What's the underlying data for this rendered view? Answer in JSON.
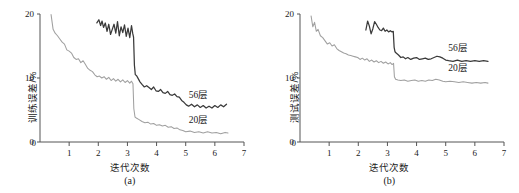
{
  "figure": {
    "caption_a": "(a)",
    "caption_b": "(b)",
    "colors": {
      "deep_series": "#3a3a3a",
      "shallow_series": "#a0a0a0",
      "axis": "#555555",
      "text": "#1a1a1a",
      "background": "#ffffff"
    }
  },
  "chart_data": [
    {
      "type": "line",
      "panel": "a",
      "title": "",
      "caption": "(a)",
      "xlabel": "迭代次数",
      "ylabel": "训练误差/%",
      "xlim": [
        0,
        7
      ],
      "ylim": [
        0,
        20
      ],
      "xticks": [
        0,
        1,
        2,
        3,
        4,
        5,
        6,
        7
      ],
      "xticklabels": [
        "0",
        "1",
        "2",
        "3",
        "4",
        "5",
        "6",
        "7"
      ],
      "yticks": [
        0,
        10,
        20
      ],
      "yticklabels": [
        "0",
        "10",
        "20"
      ],
      "grid": false,
      "legend_position": "inline-annotation",
      "annotations": [
        {
          "text": "56层",
          "x": 5.1,
          "y": 7.0
        },
        {
          "text": "20层",
          "x": 5.1,
          "y": 3.1
        }
      ],
      "series": [
        {
          "name": "56层",
          "color": "#3a3a3a",
          "x": [
            1.95,
            2.02,
            2.08,
            2.13,
            2.18,
            2.24,
            2.3,
            2.36,
            2.42,
            2.48,
            2.54,
            2.6,
            2.66,
            2.72,
            2.78,
            2.84,
            2.9,
            2.96,
            3.02,
            3.08,
            3.14,
            3.18,
            3.21,
            3.24,
            3.27,
            3.31,
            3.37,
            3.43,
            3.5,
            3.58,
            3.66,
            3.74,
            3.82,
            3.9,
            3.98,
            4.06,
            4.14,
            4.22,
            4.3,
            4.38,
            4.46,
            4.54,
            4.62,
            4.7,
            4.78,
            4.86,
            4.94,
            5.02,
            5.1,
            5.2,
            5.3,
            5.4,
            5.5,
            5.6,
            5.7,
            5.8,
            5.9,
            6.0,
            6.1,
            6.2,
            6.3,
            6.4
          ],
          "y": [
            18.6,
            19.1,
            18.2,
            18.9,
            17.9,
            18.6,
            17.3,
            18.4,
            16.8,
            17.6,
            18.4,
            17.0,
            18.8,
            16.6,
            18.0,
            17.1,
            18.3,
            16.5,
            17.8,
            16.3,
            18.2,
            17.0,
            16.4,
            12.0,
            10.5,
            10.4,
            9.9,
            9.4,
            9.0,
            8.6,
            8.8,
            8.5,
            8.2,
            8.6,
            8.0,
            7.9,
            8.2,
            7.7,
            7.6,
            7.9,
            7.4,
            7.3,
            7.5,
            7.1,
            7.0,
            6.5,
            6.2,
            5.8,
            5.6,
            5.9,
            5.5,
            5.8,
            5.4,
            5.7,
            5.3,
            5.6,
            5.3,
            5.7,
            5.4,
            5.8,
            5.5,
            5.9
          ]
        },
        {
          "name": "20层",
          "color": "#a0a0a0",
          "x": [
            0.38,
            0.45,
            0.52,
            0.6,
            0.68,
            0.76,
            0.84,
            0.92,
            1.0,
            1.08,
            1.16,
            1.24,
            1.32,
            1.4,
            1.48,
            1.56,
            1.64,
            1.72,
            1.8,
            1.88,
            1.96,
            2.04,
            2.12,
            2.2,
            2.28,
            2.36,
            2.44,
            2.52,
            2.6,
            2.68,
            2.76,
            2.84,
            2.92,
            3.0,
            3.08,
            3.14,
            3.19,
            3.22,
            3.26,
            3.32,
            3.4,
            3.5,
            3.6,
            3.7,
            3.8,
            3.9,
            4.0,
            4.1,
            4.2,
            4.3,
            4.4,
            4.5,
            4.6,
            4.7,
            4.8,
            4.9,
            5.0,
            5.15,
            5.3,
            5.45,
            5.6,
            5.75,
            5.9,
            6.05,
            6.2,
            6.35,
            6.45
          ],
          "y": [
            19.9,
            17.6,
            17.0,
            16.6,
            16.1,
            15.6,
            15.3,
            14.4,
            14.2,
            13.9,
            13.2,
            12.9,
            13.0,
            12.4,
            12.7,
            12.1,
            11.5,
            11.2,
            11.0,
            10.5,
            10.2,
            10.3,
            10.0,
            10.2,
            9.8,
            10.1,
            9.6,
            9.9,
            9.5,
            9.8,
            9.4,
            9.7,
            9.3,
            9.6,
            9.2,
            9.5,
            9.1,
            5.2,
            3.9,
            3.7,
            3.5,
            3.2,
            3.0,
            3.1,
            2.8,
            2.9,
            2.6,
            2.7,
            2.5,
            2.6,
            2.3,
            2.4,
            2.1,
            2.2,
            1.9,
            1.8,
            1.6,
            1.7,
            1.5,
            1.6,
            1.4,
            1.6,
            1.4,
            1.5,
            1.3,
            1.5,
            1.4
          ]
        }
      ]
    },
    {
      "type": "line",
      "panel": "b",
      "title": "",
      "caption": "(b)",
      "xlabel": "迭代次数",
      "ylabel": "测试误差/%",
      "xlim": [
        0,
        7
      ],
      "ylim": [
        0,
        20
      ],
      "xticks": [
        0,
        1,
        2,
        3,
        4,
        5,
        6,
        7
      ],
      "xticklabels": [
        "0",
        "1",
        "2",
        "3",
        "4",
        "5",
        "6",
        "7"
      ],
      "yticks": [
        0,
        10,
        20
      ],
      "yticklabels": [
        "0",
        "10",
        "20"
      ],
      "grid": false,
      "legend_position": "inline-annotation",
      "annotations": [
        {
          "text": "56层",
          "x": 5.1,
          "y": 14.3
        },
        {
          "text": "20层",
          "x": 5.1,
          "y": 11.2
        }
      ],
      "series": [
        {
          "name": "56层",
          "color": "#3a3a3a",
          "x": [
            2.26,
            2.32,
            2.38,
            2.44,
            2.5,
            2.56,
            2.62,
            2.68,
            2.74,
            2.8,
            2.86,
            2.92,
            2.98,
            3.04,
            3.1,
            3.16,
            3.2,
            3.23,
            3.26,
            3.3,
            3.38,
            3.46,
            3.54,
            3.62,
            3.7,
            3.8,
            3.9,
            4.0,
            4.1,
            4.2,
            4.3,
            4.4,
            4.5,
            4.6,
            4.7,
            4.8,
            4.9,
            5.0,
            5.1,
            5.25,
            5.4,
            5.55,
            5.7,
            5.85,
            6.0,
            6.15,
            6.3,
            6.45
          ],
          "y": [
            17.5,
            18.9,
            18.1,
            16.9,
            17.7,
            18.8,
            18.4,
            17.9,
            17.5,
            17.4,
            17.8,
            17.3,
            17.5,
            17.2,
            17.4,
            17.2,
            17.3,
            14.8,
            14.1,
            13.9,
            13.6,
            13.2,
            13.3,
            13.0,
            13.2,
            12.9,
            13.1,
            13.2,
            12.9,
            13.0,
            13.1,
            12.9,
            13.0,
            13.2,
            13.4,
            13.3,
            13.1,
            12.8,
            12.7,
            12.6,
            12.8,
            12.6,
            12.7,
            12.6,
            12.7,
            12.6,
            12.7,
            12.6
          ]
        },
        {
          "name": "20层",
          "color": "#a0a0a0",
          "x": [
            0.38,
            0.44,
            0.5,
            0.56,
            0.62,
            0.7,
            0.78,
            0.86,
            0.94,
            1.02,
            1.1,
            1.18,
            1.26,
            1.34,
            1.42,
            1.5,
            1.58,
            1.66,
            1.74,
            1.82,
            1.9,
            1.98,
            2.06,
            2.14,
            2.22,
            2.3,
            2.38,
            2.46,
            2.54,
            2.62,
            2.7,
            2.78,
            2.86,
            2.94,
            3.02,
            3.1,
            3.16,
            3.21,
            3.24,
            3.28,
            3.36,
            3.46,
            3.58,
            3.7,
            3.82,
            3.94,
            4.06,
            4.18,
            4.3,
            4.42,
            4.54,
            4.66,
            4.78,
            4.9,
            5.0,
            5.15,
            5.3,
            5.45,
            5.6,
            5.75,
            5.9,
            6.05,
            6.2,
            6.35,
            6.45
          ],
          "y": [
            19.7,
            18.0,
            18.7,
            17.3,
            17.6,
            16.6,
            16.3,
            15.8,
            15.3,
            15.5,
            15.0,
            15.2,
            14.6,
            14.3,
            14.1,
            13.9,
            13.8,
            13.6,
            13.5,
            13.4,
            13.3,
            13.2,
            12.9,
            13.1,
            12.8,
            13.0,
            12.6,
            12.8,
            12.5,
            12.7,
            12.4,
            12.6,
            12.3,
            12.5,
            12.2,
            12.4,
            12.1,
            12.3,
            10.2,
            9.8,
            9.7,
            9.6,
            9.7,
            9.5,
            9.6,
            9.7,
            9.5,
            9.6,
            9.5,
            9.7,
            9.6,
            9.8,
            9.7,
            9.5,
            9.4,
            9.5,
            9.4,
            9.3,
            9.4,
            9.3,
            9.2,
            9.3,
            9.2,
            9.3,
            9.2
          ]
        }
      ]
    }
  ]
}
